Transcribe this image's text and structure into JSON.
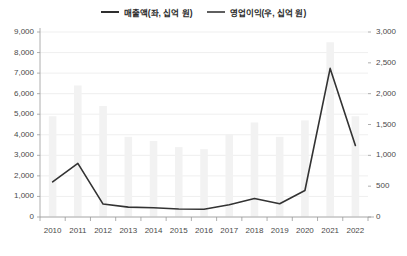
{
  "legend": {
    "position": "top-center",
    "entries": [
      {
        "label": "매출액(좌, 십억 원)",
        "style": "line",
        "color": "#2f2f2f"
      },
      {
        "label": "영업이익(우, 십억 원)",
        "style": "line",
        "color": "#5f5f5f"
      }
    ]
  },
  "chart_data": {
    "type": "bar",
    "title": "",
    "subtitle": "",
    "xlabel": "",
    "ylabel": "",
    "grid": true,
    "legend_position": "top-center",
    "categories": [
      "2010",
      "2011",
      "2012",
      "2013",
      "2014",
      "2015",
      "2016",
      "2017",
      "2018",
      "2019",
      "2020",
      "2021",
      "2022"
    ],
    "axes": {
      "left": {
        "label": "매출액(좌, 십억 원)",
        "min": 0,
        "max": 9000,
        "tick_step": 1000,
        "ticks": [
          0,
          1000,
          2000,
          3000,
          4000,
          5000,
          6000,
          7000,
          8000,
          9000
        ],
        "tick_labels": [
          "0",
          "1,000",
          "2,000",
          "3,000",
          "4,000",
          "5,000",
          "6,000",
          "7,000",
          "8,000",
          "9,000"
        ]
      },
      "right": {
        "label": "영업이익(우, 십억 원)",
        "min": 0,
        "max": 3000,
        "tick_step": 500,
        "ticks": [
          0,
          500,
          1000,
          1500,
          2000,
          2500,
          3000
        ],
        "tick_labels": [
          "0",
          "500",
          "1,000",
          "1,500",
          "2,000",
          "2,500",
          "3,000"
        ]
      }
    },
    "series": [
      {
        "name": "매출액(좌, 십억 원)",
        "type": "bar",
        "axis": "left",
        "color": "#f2f2f2",
        "values": [
          4900,
          6400,
          5400,
          3900,
          3700,
          3400,
          3300,
          4000,
          4600,
          3900,
          4700,
          8500,
          4900
        ]
      },
      {
        "name": "영업이익(우, 십억 원)",
        "type": "line",
        "axis": "right",
        "color": "#333333",
        "values": [
          570,
          870,
          210,
          160,
          150,
          130,
          125,
          200,
          300,
          215,
          430,
          2410,
          1160
        ]
      }
    ]
  }
}
